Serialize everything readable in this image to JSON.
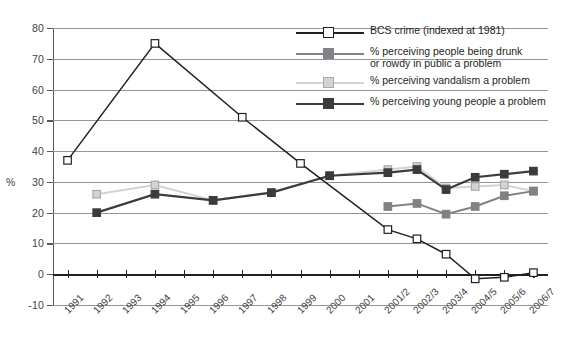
{
  "chart_data": {
    "type": "line",
    "title": "",
    "xlabel": "",
    "ylabel": "%",
    "ylim": [
      -10,
      80
    ],
    "ytick_step": 10,
    "yticks": [
      80,
      70,
      60,
      50,
      40,
      30,
      20,
      10,
      0,
      -10
    ],
    "grid": true,
    "legend_position": "top-right",
    "categories": [
      "1991",
      "1992",
      "1993",
      "1994",
      "1995",
      "1996",
      "1997",
      "1998",
      "1999",
      "2000",
      "2001",
      "2001/2",
      "2002/3",
      "2003/4",
      "2004/5",
      "2005/6",
      "2006/7"
    ],
    "series": [
      {
        "name": "BCS crime (indexed at 1981)",
        "color": "#231f20",
        "marker": "open-square",
        "marker_fill": "#ffffff",
        "values": [
          37,
          null,
          null,
          75,
          null,
          null,
          51,
          null,
          36,
          null,
          null,
          14.5,
          11.5,
          6.5,
          -1.5,
          -1,
          0.5
        ]
      },
      {
        "name": "% perceiving people being drunk or rowdy in public a problem",
        "color": "#808285",
        "marker": "filled-square",
        "marker_fill": "#808285",
        "values": [
          null,
          null,
          null,
          null,
          null,
          null,
          null,
          null,
          null,
          null,
          null,
          22,
          23,
          19.5,
          22,
          25.5,
          27
        ]
      },
      {
        "name": "% perceiving vandalism a problem",
        "color": "#d1d3d4",
        "marker": "light-square",
        "marker_fill": "#d1d3d4",
        "values": [
          null,
          26,
          null,
          29,
          null,
          24,
          null,
          26.5,
          null,
          32,
          null,
          34,
          35,
          28,
          28.5,
          29,
          27
        ]
      },
      {
        "name": "% perceiving young people a problem",
        "color": "#3b3b3d",
        "marker": "dark-square",
        "marker_fill": "#3b3b3d",
        "values": [
          null,
          20,
          null,
          26,
          null,
          24,
          null,
          26.5,
          null,
          32,
          null,
          33,
          34,
          27.5,
          31.5,
          32.5,
          33.5
        ]
      }
    ]
  },
  "legend": {
    "items": [
      {
        "label": "BCS crime (indexed at 1981)",
        "label2": ""
      },
      {
        "label": "% perceiving people being drunk",
        "label2": "or rowdy in public a problem"
      },
      {
        "label": "% perceiving vandalism a problem",
        "label2": ""
      },
      {
        "label": "% perceiving young people a problem",
        "label2": ""
      }
    ]
  }
}
